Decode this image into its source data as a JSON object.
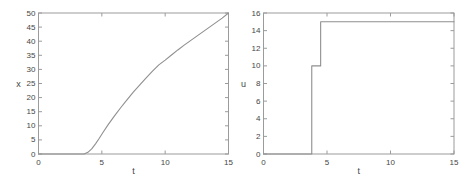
{
  "figure": {
    "background": "#ffffff",
    "axis_color": "#9b9b9b",
    "label_color": "#454545"
  },
  "chart_data": [
    {
      "type": "line",
      "title": "",
      "xlabel": "t",
      "ylabel": "x",
      "xlim": [
        0,
        15
      ],
      "ylim": [
        0,
        50
      ],
      "xticks": [
        0,
        5,
        10,
        15
      ],
      "yticks": [
        0,
        5,
        10,
        15,
        20,
        25,
        30,
        35,
        40,
        45,
        50
      ],
      "grid": false,
      "legend": null,
      "line_color": "#8f8f8f",
      "series": [
        {
          "name": "x(t)",
          "x": [
            0,
            3.6,
            3.9,
            4.2,
            4.5,
            4.8,
            5.1,
            5.5,
            6,
            6.5,
            7,
            7.5,
            8,
            8.5,
            9,
            9.5,
            10,
            10.5,
            11,
            11.5,
            12,
            12.5,
            13,
            13.5,
            14,
            14.5,
            15
          ],
          "y": [
            0,
            0,
            0.6,
            1.8,
            3.6,
            5.6,
            7.7,
            10.4,
            13.5,
            16.5,
            19.3,
            22,
            24.5,
            27,
            29.4,
            31.6,
            33.3,
            35.1,
            36.9,
            38.6,
            40.2,
            41.8,
            43.4,
            45,
            46.6,
            48.2,
            50
          ]
        }
      ]
    },
    {
      "type": "line",
      "title": "",
      "xlabel": "t",
      "ylabel": "u",
      "xlim": [
        0,
        15
      ],
      "ylim": [
        0,
        16
      ],
      "xticks": [
        0,
        5,
        10,
        15
      ],
      "yticks": [
        0,
        2,
        4,
        6,
        8,
        10,
        12,
        14,
        16
      ],
      "grid": false,
      "legend": null,
      "line_color": "#8f8f8f",
      "series": [
        {
          "name": "u(t)",
          "x": [
            0,
            3.8,
            3.8,
            4.5,
            4.5,
            15
          ],
          "y": [
            0,
            0,
            10,
            10,
            15,
            15
          ]
        }
      ]
    }
  ]
}
